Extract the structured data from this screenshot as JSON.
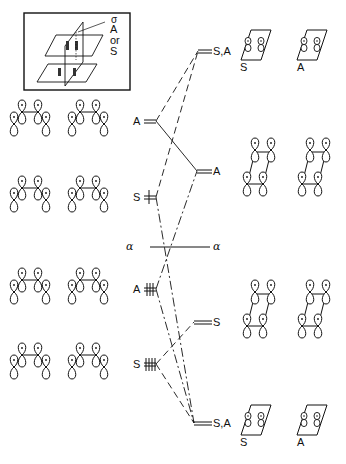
{
  "inset": {
    "label_sigma": "σ",
    "label_A": "A",
    "label_or": "or",
    "label_S": "S"
  },
  "left_levels": [
    {
      "symmetry": "A",
      "electrons": 0,
      "y": 121
    },
    {
      "symmetry": "S",
      "electrons": 1,
      "y": 197
    },
    {
      "symmetry": "A",
      "electrons": 3,
      "y": 289
    },
    {
      "symmetry": "S",
      "electrons": 4,
      "y": 364
    }
  ],
  "right_levels": [
    {
      "symmetry": "S,A",
      "y": 52
    },
    {
      "symmetry": "A",
      "y": 171
    },
    {
      "symmetry": "S",
      "y": 323
    },
    {
      "symmetry": "S,A",
      "y": 424
    }
  ],
  "alpha_line": {
    "left": "α",
    "right": "α",
    "y": 247
  },
  "top_pair_labels": {
    "left": "S",
    "right": "A"
  },
  "bottom_pair_labels": {
    "left": "S",
    "right": "A"
  },
  "left_orbital_signs": [
    [
      "−",
      "+",
      "+",
      "−"
    ],
    [
      "−",
      "−",
      "+",
      "+"
    ],
    [
      "+",
      "+",
      "+",
      "−"
    ],
    [
      "+",
      "+",
      "+",
      "+"
    ]
  ]
}
